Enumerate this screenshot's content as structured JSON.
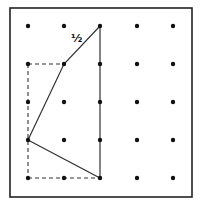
{
  "figure": {
    "type": "geoboard",
    "grid": {
      "cols": 5,
      "rows": 5,
      "x": [
        28,
        64,
        100,
        137,
        173
      ],
      "y": [
        26,
        64,
        102,
        140,
        178
      ]
    },
    "border": {
      "x": 10,
      "y": 8,
      "width": 182,
      "height": 189
    },
    "polygon": {
      "description": "quadrilateral on geoboard",
      "vertices": [
        [
          2,
          0
        ],
        [
          1,
          1
        ],
        [
          0,
          3
        ],
        [
          2,
          4
        ]
      ]
    },
    "dashed_rectangle": {
      "from": [
        0,
        1
      ],
      "to": [
        2,
        4
      ]
    },
    "label": {
      "text": "1/2",
      "display": "½",
      "x": 72,
      "y": 42
    },
    "colors": {
      "line": "#333333",
      "dot": "#111111",
      "border": "#222222"
    }
  }
}
